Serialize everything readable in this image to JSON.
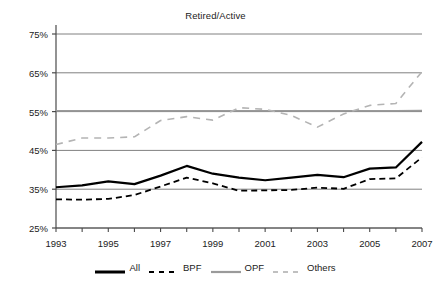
{
  "chart_data": {
    "type": "line",
    "title": "Retired/Active",
    "xlabel": "",
    "ylabel": "",
    "xlim": [
      1993,
      2007
    ],
    "ylim": [
      25,
      75
    ],
    "yticks": [
      25,
      35,
      45,
      55,
      65,
      75
    ],
    "ytick_labels": [
      "25%",
      "35%",
      "45%",
      "55%",
      "65%",
      "75%"
    ],
    "x": [
      1993,
      1994,
      1995,
      1996,
      1997,
      1998,
      1999,
      2000,
      2001,
      2002,
      2003,
      2004,
      2005,
      2006,
      2007
    ],
    "xtick_labels": [
      "1993",
      "1995",
      "1997",
      "1999",
      "2001",
      "2003",
      "2005",
      "2007"
    ],
    "xticks_labeled": [
      1993,
      1995,
      1997,
      1999,
      2001,
      2003,
      2005,
      2007
    ],
    "grid": "horizontal",
    "legend_position": "bottom",
    "series": [
      {
        "name": "All",
        "style": "solid",
        "color": "#000000",
        "width": 2.2,
        "values": [
          35.5,
          36.0,
          37.0,
          36.3,
          38.5,
          41.0,
          39.0,
          38.0,
          37.3,
          38.0,
          38.7,
          38.1,
          40.3,
          40.6,
          47.2
        ]
      },
      {
        "name": "BPF",
        "style": "dashed",
        "color": "#000000",
        "width": 1.8,
        "values": [
          32.4,
          32.3,
          32.5,
          33.5,
          35.7,
          38.0,
          36.5,
          34.6,
          34.7,
          34.8,
          35.4,
          35.1,
          37.6,
          37.8,
          43.2
        ]
      },
      {
        "name": "OPF",
        "style": "solid",
        "color": "#9a9a9a",
        "width": 1.6,
        "values": [
          55.2,
          55.2,
          55.2,
          55.2,
          55.2,
          55.2,
          55.2,
          55.2,
          55.2,
          55.2,
          55.2,
          55.2,
          55.2,
          55.2,
          55.3
        ]
      },
      {
        "name": "Others",
        "style": "dashed",
        "color": "#b4b4b4",
        "width": 1.6,
        "values": [
          46.5,
          48.2,
          48.2,
          48.5,
          52.7,
          53.7,
          52.8,
          56.0,
          55.6,
          54.0,
          51.0,
          54.4,
          56.6,
          57.1,
          65.3
        ]
      }
    ]
  },
  "axis": {
    "ytick_labels": [
      "75%",
      "65%",
      "55%",
      "45%",
      "35%",
      "25%"
    ],
    "xtick_labels": [
      "1993",
      "1995",
      "1997",
      "1999",
      "2001",
      "2003",
      "2005",
      "2007"
    ]
  },
  "legend": {
    "items": [
      {
        "label": "All",
        "color": "#000000",
        "style": "solid"
      },
      {
        "label": "BPF",
        "color": "#000000",
        "style": "dashed"
      },
      {
        "label": "OPF",
        "color": "#9a9a9a",
        "style": "solid"
      },
      {
        "label": "Others",
        "color": "#c0c0c0",
        "style": "dashed"
      }
    ]
  },
  "colors": {
    "grid": "#808080",
    "axis": "#4a4a4a",
    "text": "#222222",
    "background": "#ffffff"
  }
}
